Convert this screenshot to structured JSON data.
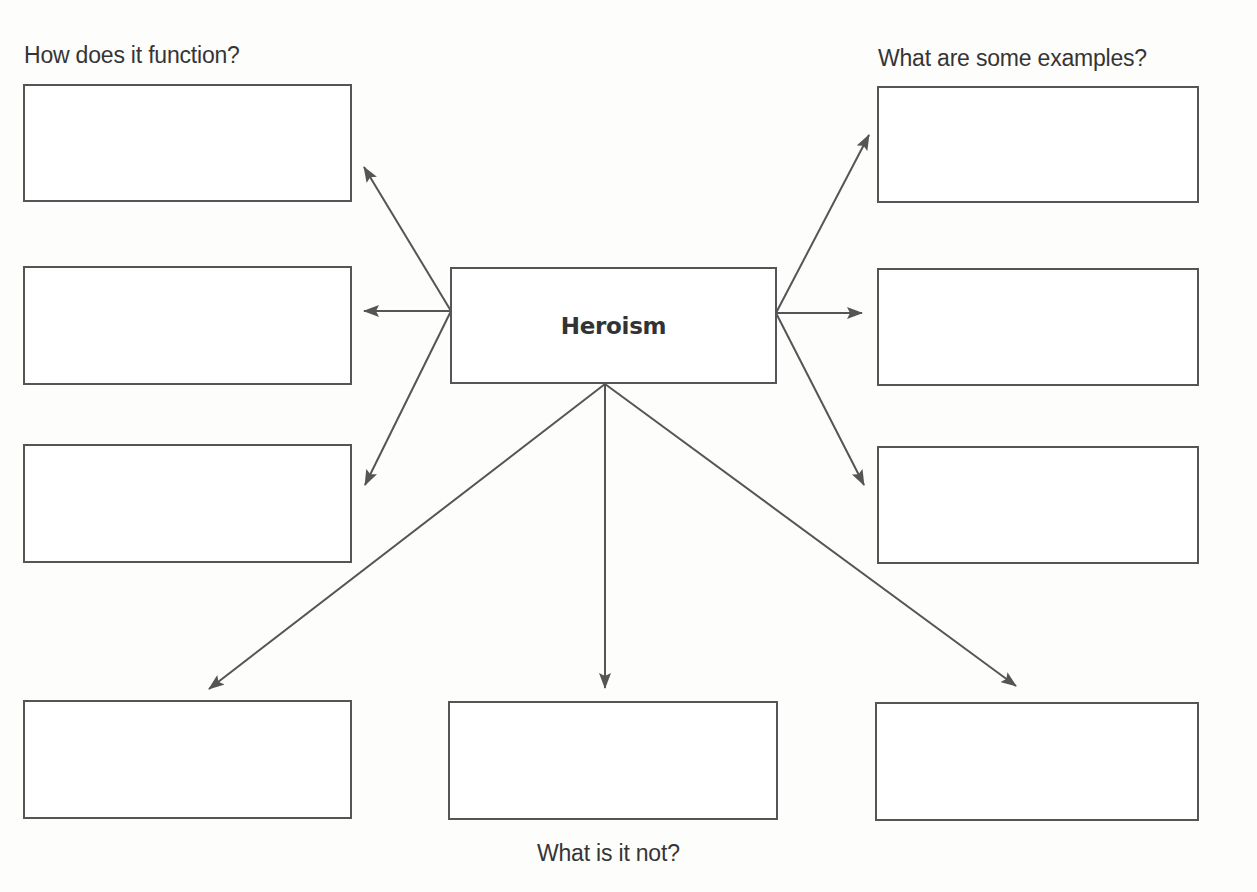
{
  "diagram": {
    "central_concept": "Heroism",
    "colors": {
      "stroke": "#555555",
      "text": "#353535",
      "background": "#fdfdfc"
    },
    "groups": {
      "left": {
        "heading": "How does it function?",
        "boxes": [
          {
            "content": ""
          },
          {
            "content": ""
          },
          {
            "content": ""
          }
        ]
      },
      "right": {
        "heading": "What are some examples?",
        "boxes": [
          {
            "content": ""
          },
          {
            "content": ""
          },
          {
            "content": ""
          }
        ]
      },
      "bottom": {
        "heading": "What is it not?",
        "boxes": [
          {
            "content": ""
          },
          {
            "content": ""
          },
          {
            "content": ""
          }
        ]
      }
    }
  }
}
